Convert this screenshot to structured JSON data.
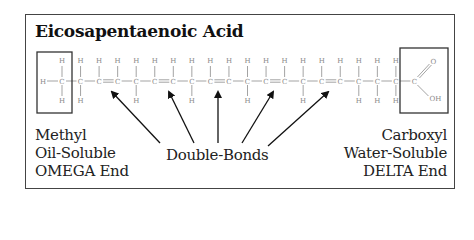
{
  "title": "Eicosapentaenoic Acid",
  "molecule": {
    "name": "Eicosapentaenoic Acid",
    "carbon_count": 20,
    "double_bond_count": 5,
    "atom_labels": {
      "carbon": "C",
      "hydrogen": "H",
      "oxygen": "O",
      "hydroxyl": "OH"
    }
  },
  "labels": {
    "left": [
      "Methyl",
      "Oil-Soluble",
      "OMEGA End"
    ],
    "center": "Double-Bonds",
    "right": [
      "Carboxyl",
      "Water-Soluble",
      "DELTA End"
    ]
  },
  "colors": {
    "frame": "#444444",
    "text": "#222222",
    "bonds": "#888888",
    "arrows": "#111111"
  }
}
